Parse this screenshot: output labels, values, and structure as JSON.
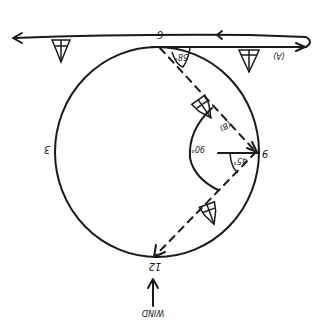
{
  "diagram": {
    "orientation": "rotated 180 degrees",
    "clock_labels": {
      "twelve": "12",
      "three": "3",
      "six": "6",
      "nine": "9"
    },
    "path_labels": {
      "a": "(A)",
      "b": "(B)"
    },
    "angles": {
      "top_angle": "58°",
      "right_angle": "45°",
      "arc_angle": "90°"
    },
    "wind": {
      "label": "WIND",
      "arrow": "wind-arrow"
    },
    "boats": [
      {
        "name": "boat-left-top"
      },
      {
        "name": "boat-right-top"
      },
      {
        "name": "boat-upper-dashed"
      },
      {
        "name": "boat-lower-dashed"
      }
    ],
    "colors": {
      "ink": "#1a1a1a",
      "paper": "#ffffff"
    }
  }
}
